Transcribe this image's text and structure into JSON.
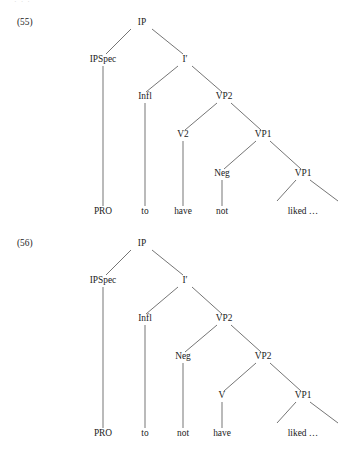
{
  "page": {
    "width": 360,
    "height": 451,
    "background": "#ffffff",
    "ink_color": "#222222",
    "line_color": "#3a3a3a",
    "top_edge_artifact": "· · ·"
  },
  "figures": [
    {
      "id": "figure-55",
      "number_label": "(55)",
      "number_x": 17,
      "number_y": 25,
      "nodes": [
        {
          "name": "ip",
          "label": "IP",
          "x": 142,
          "y": 25
        },
        {
          "name": "ipspec",
          "label": "IPSpec",
          "x": 103,
          "y": 62
        },
        {
          "name": "ibar",
          "label": "I′",
          "x": 185,
          "y": 62
        },
        {
          "name": "infl",
          "label": "Infl",
          "x": 145,
          "y": 99
        },
        {
          "name": "vp2",
          "label": "VP2",
          "x": 224,
          "y": 99
        },
        {
          "name": "v2",
          "label": "V2",
          "x": 183,
          "y": 137
        },
        {
          "name": "vp1-upper",
          "label": "VP1",
          "x": 263,
          "y": 137
        },
        {
          "name": "neg",
          "label": "Neg",
          "x": 222,
          "y": 176
        },
        {
          "name": "vp1-lower",
          "label": "VP1",
          "x": 303,
          "y": 176
        }
      ],
      "leaves": [
        {
          "name": "leaf-pro",
          "label": "PRO",
          "x": 103,
          "y": 214
        },
        {
          "name": "leaf-to",
          "label": "to",
          "x": 145,
          "y": 214
        },
        {
          "name": "leaf-have",
          "label": "have",
          "x": 183,
          "y": 214
        },
        {
          "name": "leaf-not",
          "label": "not",
          "x": 222,
          "y": 214
        },
        {
          "name": "leaf-liked",
          "label": "liked …",
          "x": 303,
          "y": 214
        }
      ],
      "branches": [
        {
          "name": "ip-to-ipspec",
          "x1": 131,
          "y1": 29,
          "x2": 106,
          "y2": 54
        },
        {
          "name": "ip-to-ibar",
          "x1": 152,
          "y1": 29,
          "x2": 183,
          "y2": 54
        },
        {
          "name": "ibar-to-infl",
          "x1": 178,
          "y1": 66,
          "x2": 146,
          "y2": 92
        },
        {
          "name": "ibar-to-vp2",
          "x1": 192,
          "y1": 66,
          "x2": 222,
          "y2": 92
        },
        {
          "name": "vp2-to-v2",
          "x1": 217,
          "y1": 103,
          "x2": 185,
          "y2": 130
        },
        {
          "name": "vp2-to-vp1upper",
          "x1": 231,
          "y1": 103,
          "x2": 261,
          "y2": 130
        },
        {
          "name": "vp1upper-to-neg",
          "x1": 256,
          "y1": 141,
          "x2": 224,
          "y2": 169
        },
        {
          "name": "vp1upper-to-vp1low",
          "x1": 270,
          "y1": 141,
          "x2": 301,
          "y2": 169
        },
        {
          "name": "vp1low-left-open",
          "x1": 296,
          "y1": 180,
          "x2": 277,
          "y2": 201
        },
        {
          "name": "vp1low-right-open",
          "x1": 310,
          "y1": 180,
          "x2": 338,
          "y2": 201
        }
      ],
      "stems": [
        {
          "name": "ipspec-stem",
          "x1": 103,
          "y1": 66,
          "x2": 103,
          "y2": 206
        },
        {
          "name": "infl-stem",
          "x1": 145,
          "y1": 103,
          "x2": 145,
          "y2": 206
        },
        {
          "name": "v2-stem",
          "x1": 183,
          "y1": 141,
          "x2": 183,
          "y2": 206
        },
        {
          "name": "neg-stem",
          "x1": 222,
          "y1": 180,
          "x2": 222,
          "y2": 206
        }
      ]
    },
    {
      "id": "figure-56",
      "number_label": "(56)",
      "number_x": 17,
      "number_y": 246,
      "nodes": [
        {
          "name": "ip",
          "label": "IP",
          "x": 142,
          "y": 246
        },
        {
          "name": "ipspec",
          "label": "IPSpec",
          "x": 103,
          "y": 283
        },
        {
          "name": "ibar",
          "label": "I′",
          "x": 185,
          "y": 283
        },
        {
          "name": "infl",
          "label": "Infl",
          "x": 145,
          "y": 321
        },
        {
          "name": "vp2-upper",
          "label": "VP2",
          "x": 224,
          "y": 321
        },
        {
          "name": "neg",
          "label": "Neg",
          "x": 183,
          "y": 359
        },
        {
          "name": "vp2-lower",
          "label": "VP2",
          "x": 263,
          "y": 359
        },
        {
          "name": "v",
          "label": "V",
          "x": 222,
          "y": 398
        },
        {
          "name": "vp1",
          "label": "VP1",
          "x": 303,
          "y": 398
        }
      ],
      "leaves": [
        {
          "name": "leaf-pro",
          "label": "PRO",
          "x": 103,
          "y": 436
        },
        {
          "name": "leaf-to",
          "label": "to",
          "x": 145,
          "y": 436
        },
        {
          "name": "leaf-not",
          "label": "not",
          "x": 183,
          "y": 436
        },
        {
          "name": "leaf-have",
          "label": "have",
          "x": 222,
          "y": 436
        },
        {
          "name": "leaf-liked",
          "label": "liked …",
          "x": 303,
          "y": 436
        }
      ],
      "branches": [
        {
          "name": "ip-to-ipspec",
          "x1": 131,
          "y1": 250,
          "x2": 106,
          "y2": 275
        },
        {
          "name": "ip-to-ibar",
          "x1": 152,
          "y1": 250,
          "x2": 183,
          "y2": 275
        },
        {
          "name": "ibar-to-infl",
          "x1": 178,
          "y1": 287,
          "x2": 146,
          "y2": 314
        },
        {
          "name": "ibar-to-vp2up",
          "x1": 192,
          "y1": 287,
          "x2": 222,
          "y2": 314
        },
        {
          "name": "vp2up-to-neg",
          "x1": 217,
          "y1": 325,
          "x2": 185,
          "y2": 352
        },
        {
          "name": "vp2up-to-vp2low",
          "x1": 231,
          "y1": 325,
          "x2": 261,
          "y2": 352
        },
        {
          "name": "vp2low-to-v",
          "x1": 256,
          "y1": 363,
          "x2": 224,
          "y2": 391
        },
        {
          "name": "vp2low-to-vp1",
          "x1": 270,
          "y1": 363,
          "x2": 301,
          "y2": 391
        },
        {
          "name": "vp1-left-open",
          "x1": 296,
          "y1": 402,
          "x2": 277,
          "y2": 423
        },
        {
          "name": "vp1-right-open",
          "x1": 310,
          "y1": 402,
          "x2": 338,
          "y2": 423
        }
      ],
      "stems": [
        {
          "name": "ipspec-stem",
          "x1": 103,
          "y1": 287,
          "x2": 103,
          "y2": 428
        },
        {
          "name": "infl-stem",
          "x1": 145,
          "y1": 325,
          "x2": 145,
          "y2": 428
        },
        {
          "name": "neg-stem",
          "x1": 183,
          "y1": 363,
          "x2": 183,
          "y2": 428
        },
        {
          "name": "v-stem",
          "x1": 222,
          "y1": 402,
          "x2": 222,
          "y2": 428
        }
      ]
    }
  ]
}
